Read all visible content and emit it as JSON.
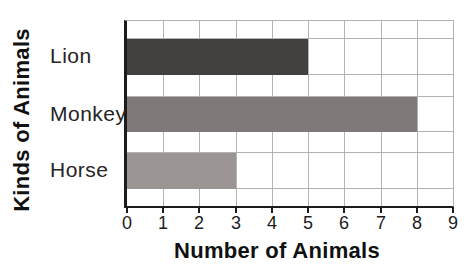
{
  "chart_data": {
    "type": "bar",
    "orientation": "horizontal",
    "xlabel": "Number of Animals",
    "ylabel": "Kinds of Animals",
    "categories": [
      "Lion",
      "Monkey",
      "Horse"
    ],
    "values": [
      5,
      8,
      3
    ],
    "xlim": [
      0,
      9
    ],
    "xticks": [
      0,
      1,
      2,
      3,
      4,
      5,
      6,
      7,
      8,
      9
    ],
    "grid": true,
    "legend": false,
    "bar_colors": [
      "#434040",
      "#7e7878",
      "#9b9594"
    ],
    "axis_color": "#1c1c1c",
    "grid_color": "#b3b3b3",
    "background_color": "#ffffff"
  }
}
